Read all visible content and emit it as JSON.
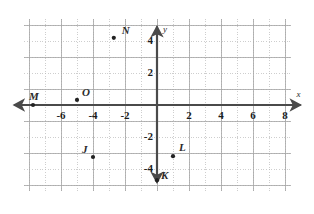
{
  "chart_data": {
    "type": "scatter",
    "title": "",
    "xlabel": "x",
    "ylabel": "y",
    "xlim": [
      -8.3,
      8.4
    ],
    "ylim": [
      -5.4,
      5.4
    ],
    "grid": true,
    "grid_step": 1,
    "legend": "none",
    "x_ticks": [
      -6,
      -4,
      -2,
      2,
      4,
      6,
      8
    ],
    "x_tick_labels": [
      "-6",
      "-4",
      "-2",
      "2",
      "4",
      "6",
      "8"
    ],
    "y_ticks": [
      4,
      2,
      -2,
      -4
    ],
    "y_tick_labels": [
      "4",
      "2",
      "-2",
      "-4"
    ],
    "points": [
      {
        "label": "N",
        "x": -2.7,
        "y": 4.2,
        "label_dx": 8,
        "label_dy": -13
      },
      {
        "label": "O",
        "x": -5.0,
        "y": 0.32,
        "label_dx": 5,
        "label_dy": -13
      },
      {
        "label": "M",
        "x": -7.75,
        "y": 0.0,
        "label_dx": -4,
        "label_dy": -14
      },
      {
        "label": "J",
        "x": -4.0,
        "y": -3.25,
        "label_dx": -11,
        "label_dy": -13
      },
      {
        "label": "L",
        "x": 1.0,
        "y": -3.2,
        "label_dx": 6,
        "label_dy": -14
      },
      {
        "label": "K",
        "x": 0.0,
        "y": -4.7,
        "label_dx": 4,
        "label_dy": -10
      }
    ]
  },
  "colors": {
    "axis": "#4a4a4a",
    "grid": "#b9b9b9",
    "point": "#222222",
    "text": "#1c1c1c",
    "background": "#ffffff"
  },
  "axes": {
    "x_axis_name": "x",
    "y_axis_name": "y"
  }
}
